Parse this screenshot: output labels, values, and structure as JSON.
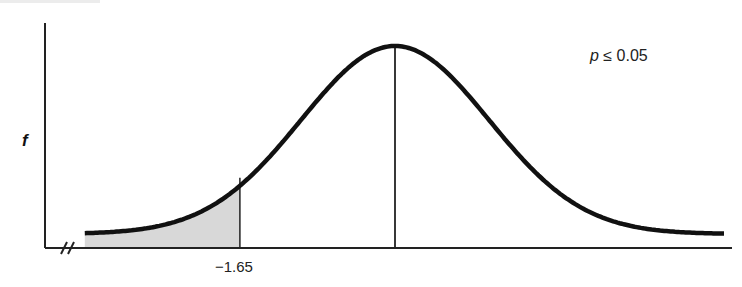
{
  "chart_data": {
    "type": "line",
    "title": "",
    "subtitle": "One-tailed normal distribution test (left tail rejection region)",
    "xlabel": "",
    "ylabel": "f",
    "annotation": "p ≤ 0.05",
    "annotation_parts": {
      "variable": "p",
      "relation": "≤",
      "value": "0.05"
    },
    "critical_value": -1.65,
    "critical_value_label": "−1.65",
    "mean_line": true,
    "shaded_region": {
      "from": "-inf",
      "to": -1.65,
      "color": "#d8d8d8"
    },
    "axis_break": true,
    "grid": false,
    "legend": null,
    "series": [
      {
        "name": "normal density",
        "x": [
          -4,
          -3,
          -2,
          -1.65,
          -1,
          0,
          1,
          2,
          3,
          4
        ],
        "values": [
          0.0001,
          0.0044,
          0.054,
          0.1023,
          0.242,
          0.3989,
          0.242,
          0.054,
          0.0044,
          0.0001
        ]
      }
    ],
    "colors": {
      "curve": "#111111",
      "axis": "#222222",
      "shade": "#d8d8d8"
    }
  }
}
